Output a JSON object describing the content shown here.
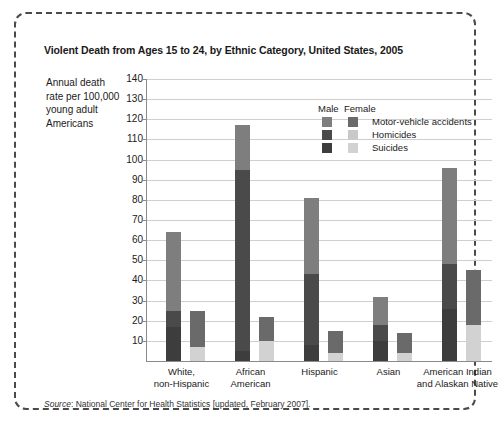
{
  "chart_data": {
    "type": "bar",
    "subtype": "stacked-grouped-bar",
    "title": "Violent Death from Ages 15 to 24, by Ethnic Category, United States, 2005",
    "xlabel": "",
    "ylabel": "Annual death rate per 100,000 young adult Americans",
    "ylim": [
      0,
      140
    ],
    "ytick_step": 10,
    "yticks": [
      10,
      20,
      30,
      40,
      50,
      60,
      70,
      80,
      90,
      100,
      110,
      120,
      130,
      140
    ],
    "grid": true,
    "legend_position": "inside-top-right",
    "categories": [
      "White, non-Hispanic",
      "African American",
      "Hispanic",
      "Asian",
      "American Indian and Alaskan Native"
    ],
    "category_lines": [
      [
        "White,",
        "non-Hispanic"
      ],
      [
        "African",
        "American"
      ],
      [
        "Hispanic",
        ""
      ],
      [
        "Asian",
        ""
      ],
      [
        "American Indian",
        "and Alaskan Native"
      ]
    ],
    "stack_order": [
      "Suicides",
      "Homicides",
      "Motor-vehicle accidents"
    ],
    "series": [
      {
        "name": "Male - Motor-vehicle accidents",
        "sex": "Male",
        "cause": "Motor-vehicle accidents",
        "values": [
          39,
          22,
          38,
          14,
          48
        ]
      },
      {
        "name": "Male - Homicides",
        "sex": "Male",
        "cause": "Homicides",
        "values": [
          8,
          90,
          35,
          8,
          22
        ]
      },
      {
        "name": "Male - Suicides",
        "sex": "Male",
        "cause": "Suicides",
        "values": [
          17,
          5,
          8,
          10,
          26
        ]
      },
      {
        "name": "Female - Motor-vehicle accidents",
        "sex": "Female",
        "cause": "Motor-vehicle accidents",
        "values": [
          18,
          12,
          11,
          10,
          27
        ]
      },
      {
        "name": "Female - Homicides",
        "sex": "Female",
        "cause": "Homicides",
        "values": [
          0,
          0,
          0,
          0,
          0
        ]
      },
      {
        "name": "Female - Suicides",
        "sex": "Female",
        "cause": "Suicides",
        "values": [
          7,
          10,
          4,
          4,
          18
        ]
      }
    ],
    "totals": {
      "male": [
        64,
        117,
        81,
        32,
        96
      ],
      "female": [
        25,
        22,
        15,
        14,
        45
      ]
    }
  },
  "legend": {
    "male_header": "Male",
    "female_header": "Female",
    "rows": [
      {
        "label": "Motor-vehicle accidents",
        "male_color": "#7e7e7e",
        "female_color": "#6a6a6a"
      },
      {
        "label": "Homicides",
        "male_color": "#4a4a4a",
        "female_color": "#c9c9c9"
      },
      {
        "label": "Suicides",
        "male_color": "#3d3d3d",
        "female_color": "#d2d2d2"
      }
    ]
  },
  "colors": {
    "male_motor_vehicle": "#7e7e7e",
    "male_homicides": "#4a4a4a",
    "male_suicides": "#3d3d3d",
    "female_motor_vehicle": "#6a6a6a",
    "female_homicides": "#c9c9c9",
    "female_suicides": "#d2d2d2",
    "gridline": "#cfcfcf",
    "axis": "#8a8a8a",
    "frame_border": "#4a4a4a"
  },
  "source": {
    "prefix": "Source",
    "text": ": National Center for Health Statistics [updated, February 2007]."
  }
}
